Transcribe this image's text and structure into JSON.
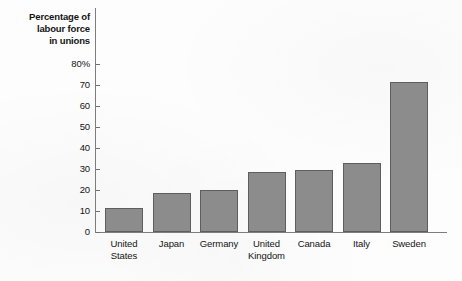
{
  "chart_data": {
    "type": "bar",
    "title": "",
    "ylabel": "Percentage of labour force in unions",
    "xlabel": "",
    "ylim": [
      0,
      80
    ],
    "grid": false,
    "legend": "none",
    "y_ticks": [
      "0",
      "10",
      "20",
      "30",
      "40",
      "50",
      "60",
      "70",
      "80%"
    ],
    "y_tick_values": [
      0,
      10,
      20,
      30,
      40,
      50,
      60,
      70,
      80
    ],
    "categories": [
      "United States",
      "Japan",
      "Germany",
      "United Kingdom",
      "Canada",
      "Italy",
      "Sweden"
    ],
    "values": [
      11.5,
      18.5,
      20,
      28.5,
      29.5,
      33,
      71.5
    ],
    "bar_color": "#8c8c8c",
    "bar_border_color": "#5e5e5e",
    "axis_color": "#7d7d7d",
    "text_color": "#141414",
    "background_color": "#fdfdfd"
  },
  "axis_title": {
    "line1": "Percentage of",
    "line2": "labour force",
    "line3": "in unions"
  }
}
